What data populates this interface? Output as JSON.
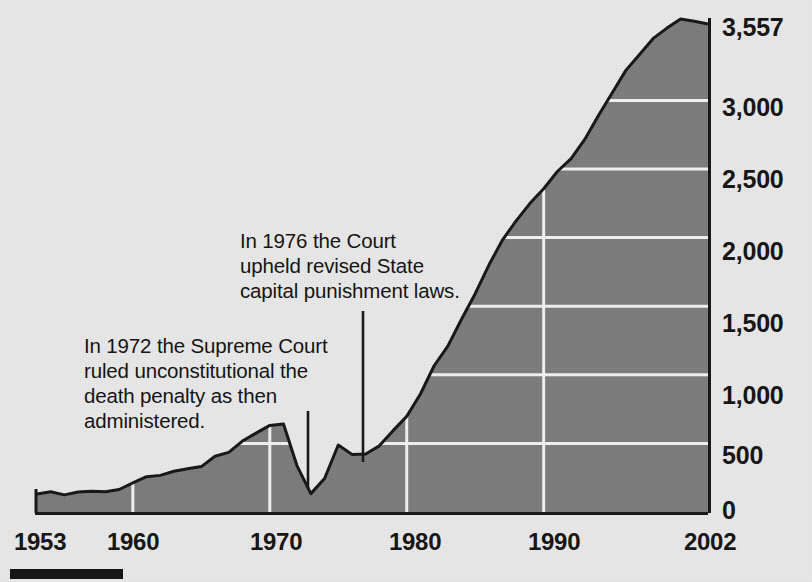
{
  "chart_data": {
    "type": "area",
    "title": "",
    "subtitle": "",
    "xlabel": "",
    "ylabel": "",
    "grid": true,
    "legend_position": "none",
    "xlim": [
      1953,
      2002
    ],
    "ylim": [
      0,
      3557
    ],
    "x_tick_labels": [
      "1953",
      "1960",
      "1970",
      "1980",
      "1990",
      "2002"
    ],
    "x_tick_values": [
      1953,
      1960,
      1970,
      1980,
      1990,
      2002
    ],
    "y_tick_labels": [
      "0",
      "500",
      "1,000",
      "1,500",
      "2,000",
      "2,500",
      "3,000",
      "3,557"
    ],
    "y_tick_values": [
      0,
      500,
      1000,
      1500,
      2000,
      2500,
      3000,
      3557
    ],
    "series": [
      {
        "name": "Prisoners under sentence of death",
        "x": [
          1953,
          1954,
          1955,
          1956,
          1957,
          1958,
          1959,
          1960,
          1961,
          1962,
          1963,
          1964,
          1965,
          1966,
          1967,
          1968,
          1969,
          1970,
          1971,
          1972,
          1973,
          1974,
          1975,
          1976,
          1977,
          1978,
          1979,
          1980,
          1981,
          1982,
          1983,
          1984,
          1985,
          1986,
          1987,
          1988,
          1989,
          1990,
          1991,
          1992,
          1993,
          1994,
          1995,
          1996,
          1997,
          1998,
          1999,
          2000,
          2001,
          2002
        ],
        "values": [
          131,
          147,
          125,
          146,
          151,
          147,
          164,
          212,
          257,
          267,
          297,
          315,
          331,
          406,
          435,
          517,
          575,
          631,
          642,
          334,
          134,
          244,
          488,
          420,
          423,
          482,
          593,
          697,
          860,
          1066,
          1209,
          1405,
          1591,
          1800,
          1984,
          2124,
          2250,
          2356,
          2482,
          2575,
          2716,
          2890,
          3054,
          3219,
          3335,
          3452,
          3527,
          3593,
          3577,
          3557
        ]
      }
    ],
    "annotations": [
      {
        "id": "annot-1972",
        "text": "In 1972 the Supreme Court\nruled unconstitutional the\ndeath penalty as then\nadministered.",
        "points_to_year": 1972
      },
      {
        "id": "annot-1976",
        "text": "In 1976 the Court\nupheld revised State\ncapital punishment laws.",
        "points_to_year": 1976
      }
    ],
    "colors": {
      "area_fill": "#7b7b7b",
      "area_stroke": "#141414",
      "gridline": "#f0f0f0",
      "background": "#e9e9e9",
      "text": "#111111",
      "source_bar": "#111111"
    }
  },
  "axis": {
    "y_labels": [
      {
        "text": "3,557",
        "top": 13
      },
      {
        "text": "3,000",
        "top": 93
      },
      {
        "text": "2,500",
        "top": 165
      },
      {
        "text": "2,000",
        "top": 237
      },
      {
        "text": "1,500",
        "top": 309
      },
      {
        "text": "1,000",
        "top": 381
      },
      {
        "text": "500",
        "top": 441
      },
      {
        "text": "0",
        "top": 496
      }
    ],
    "x_labels": [
      {
        "text": "1953",
        "left": 14
      },
      {
        "text": "1960",
        "left": 107
      },
      {
        "text": "1970",
        "left": 250
      },
      {
        "text": "1980",
        "left": 389
      },
      {
        "text": "1990",
        "left": 528
      },
      {
        "text": "2002",
        "left": 684
      }
    ]
  },
  "annotations": {
    "a1972": "In 1972 the Supreme Court\nruled unconstitutional the\ndeath penalty as then\nadministered.",
    "a1976": "In 1976 the Court\nupheld revised State\ncapital punishment laws."
  }
}
